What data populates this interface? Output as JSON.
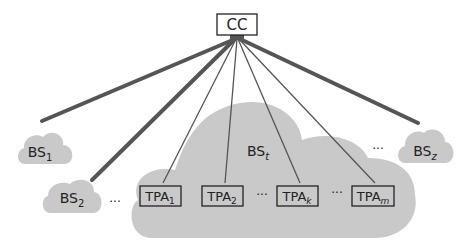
{
  "diagram": {
    "colors": {
      "cloud_fill": "#c9c9c9",
      "line": "#555555",
      "text": "#222222",
      "background": "#ffffff"
    },
    "cc": {
      "label": "CC"
    },
    "base_stations": [
      {
        "id": "bs1",
        "main": "BS",
        "sub": "1"
      },
      {
        "id": "bs2",
        "main": "BS",
        "sub": "2"
      },
      {
        "id": "bst",
        "main": "BS",
        "sub": "t"
      },
      {
        "id": "bsz",
        "main": "BS",
        "sub": "z"
      }
    ],
    "tpas": [
      {
        "id": "tpa1",
        "main": "TPA",
        "sub": "1"
      },
      {
        "id": "tpa2",
        "main": "TPA",
        "sub": "2"
      },
      {
        "id": "tpak",
        "main": "TPA",
        "sub": "k"
      },
      {
        "id": "tpam",
        "main": "TPA",
        "sub": "m"
      }
    ],
    "ellipsis": "···"
  }
}
